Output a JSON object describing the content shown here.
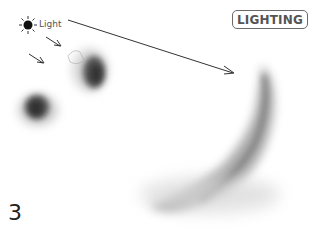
{
  "title_badge": "LIGHTING",
  "light_label": "Light",
  "step_number": "3",
  "icons": {
    "light_source": "sun-icon"
  },
  "colors": {
    "ink": "#333333",
    "badge_border": "#6a6a6a",
    "badge_text": "#555555",
    "background": "#ffffff"
  }
}
